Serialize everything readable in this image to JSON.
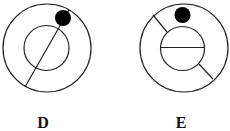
{
  "figures": [
    {
      "label": "D",
      "outer_circle": {
        "cx": 47,
        "cy": 48,
        "r": 44
      },
      "inner_circle": {
        "cx": 46.5,
        "cy": 48,
        "r": 22.5
      },
      "dot": {
        "cx": 63,
        "cy": 18,
        "r": 8
      },
      "lines": [
        {
          "x1": 69,
          "y1": 10,
          "x2": 25,
          "y2": 87
        }
      ],
      "label_pos": {
        "x": 43,
        "y": 128
      }
    },
    {
      "label": "E",
      "outer_circle": {
        "cx": 184,
        "cy": 48,
        "r": 44
      },
      "inner_circle": {
        "cx": 182.5,
        "cy": 48.5,
        "r": 22
      },
      "dot": {
        "cx": 182.5,
        "cy": 15,
        "r": 8
      },
      "lines": [
        {
          "x1": 160.5,
          "y1": 47.5,
          "x2": 204.5,
          "y2": 47.5
        },
        {
          "x1": 153,
          "y1": 15,
          "x2": 167,
          "y2": 32
        },
        {
          "x1": 199,
          "y1": 64,
          "x2": 213,
          "y2": 79
        }
      ],
      "label_pos": {
        "x": 181,
        "y": 128
      }
    }
  ],
  "colors": {
    "stroke": "#222222",
    "dot": "#000000",
    "background": "#ffffff"
  }
}
